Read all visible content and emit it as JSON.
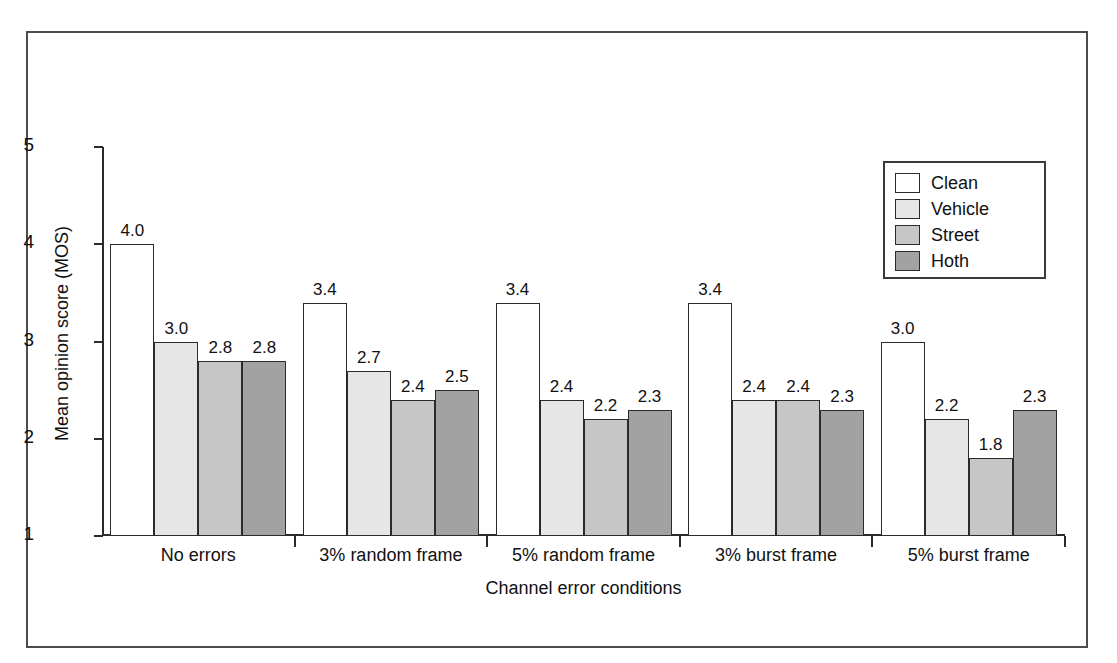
{
  "figure": {
    "top_bleed_text": "",
    "frame_color": "#4c4c4c",
    "axis_color": "#2b2b2b"
  },
  "chart_data": {
    "type": "bar",
    "title": "",
    "subtitle": "",
    "xlabel": "Channel error conditions",
    "ylabel": "Mean opinion score (MOS)",
    "ylim": [
      1,
      5
    ],
    "yticks": [
      1,
      2,
      3,
      4,
      5
    ],
    "ytick_labels": [
      "1",
      "2",
      "3",
      "4",
      "5"
    ],
    "grid": false,
    "legend_position": "top-right",
    "categories": [
      "No errors",
      "3% random frame",
      "5% random frame",
      "3% burst frame",
      "5% burst frame"
    ],
    "series": [
      {
        "name": "Clean",
        "color": "#ffffff",
        "values": [
          4.0,
          3.4,
          3.4,
          3.4,
          3.0
        ],
        "labels": [
          "4.0",
          "3.4",
          "3.4",
          "3.4",
          "3.0"
        ]
      },
      {
        "name": "Vehicle",
        "color": "#e6e6e6",
        "values": [
          3.0,
          2.7,
          2.4,
          2.4,
          2.2
        ],
        "labels": [
          "3.0",
          "2.7",
          "2.4",
          "2.4",
          "2.2"
        ]
      },
      {
        "name": "Street",
        "color": "#c6c6c6",
        "values": [
          2.8,
          2.4,
          2.2,
          2.4,
          1.8
        ],
        "labels": [
          "2.8",
          "2.4",
          "2.2",
          "2.4",
          "1.8"
        ]
      },
      {
        "name": "Hoth",
        "color": "#a2a2a2",
        "values": [
          2.8,
          2.5,
          2.3,
          2.3,
          2.3
        ],
        "labels": [
          "2.8",
          "2.5",
          "2.3",
          "2.3",
          "2.3"
        ]
      }
    ]
  }
}
